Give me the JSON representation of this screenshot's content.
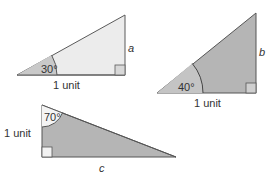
{
  "colors": {
    "light_fill": "#ebebeb",
    "dark_fill": "#b4b4b4",
    "angle_fill_light": "#c8c8c8",
    "stroke": "#555555",
    "text": "#333333"
  },
  "triangles": [
    {
      "id": "triangle-a",
      "angle_label": "30°",
      "base_label": "1 unit",
      "unknown_side_label": "a"
    },
    {
      "id": "triangle-b",
      "angle_label": "40°",
      "base_label": "1 unit",
      "unknown_side_label": "b"
    },
    {
      "id": "triangle-c",
      "angle_label": "70°",
      "side_label": "1 unit",
      "unknown_side_label": "c"
    }
  ]
}
